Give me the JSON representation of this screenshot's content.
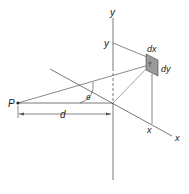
{
  "diagram": {
    "title": "",
    "labels": {
      "y_axis": "y",
      "y_coord": "y",
      "x_axis": "x",
      "x_coord": "x",
      "point": "P",
      "distance": "d",
      "angle": "θ",
      "element_width": "dx",
      "element_height": "dy"
    },
    "colors": {
      "line": "#555555",
      "element_fill": "#9a9a9a",
      "text": "#222222",
      "background": "#ffffff"
    }
  }
}
